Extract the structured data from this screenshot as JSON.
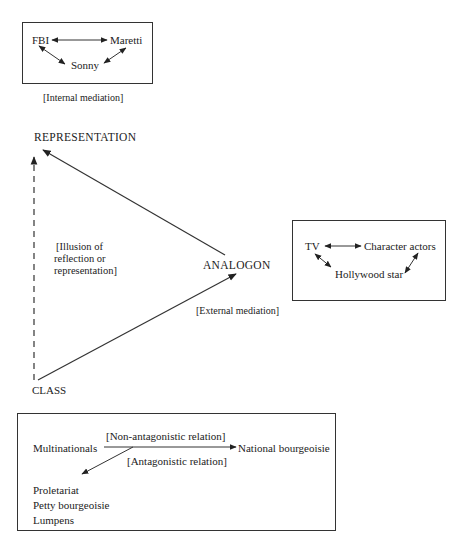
{
  "internal_box": {
    "nodes": {
      "fbi": "FBI",
      "maretti": "Maretti",
      "sonny": "Sonny"
    },
    "caption": "[Internal mediation]"
  },
  "triangle": {
    "representation": "REPRESENTATION",
    "analogon": "ANALOGON",
    "class": "CLASS",
    "illusion_label": [
      "[Illusion of",
      "reflection or",
      "representation]"
    ],
    "external_label": "[External mediation]"
  },
  "external_box": {
    "nodes": {
      "tv": "TV",
      "character_actors": "Character actors",
      "hollywood_star": "Hollywood star"
    }
  },
  "class_box": {
    "multinationals": "Multinationals",
    "national_bourgeoisie": "National bourgeoisie",
    "non_antagonistic": "[Non-antagonistic relation]",
    "antagonistic": "[Antagonistic relation]",
    "classes": [
      "Proletariat",
      "Petty bourgeoisie",
      "Lumpens"
    ]
  },
  "colors": {
    "line": "#333333",
    "text": "#222222",
    "background": "#ffffff"
  }
}
